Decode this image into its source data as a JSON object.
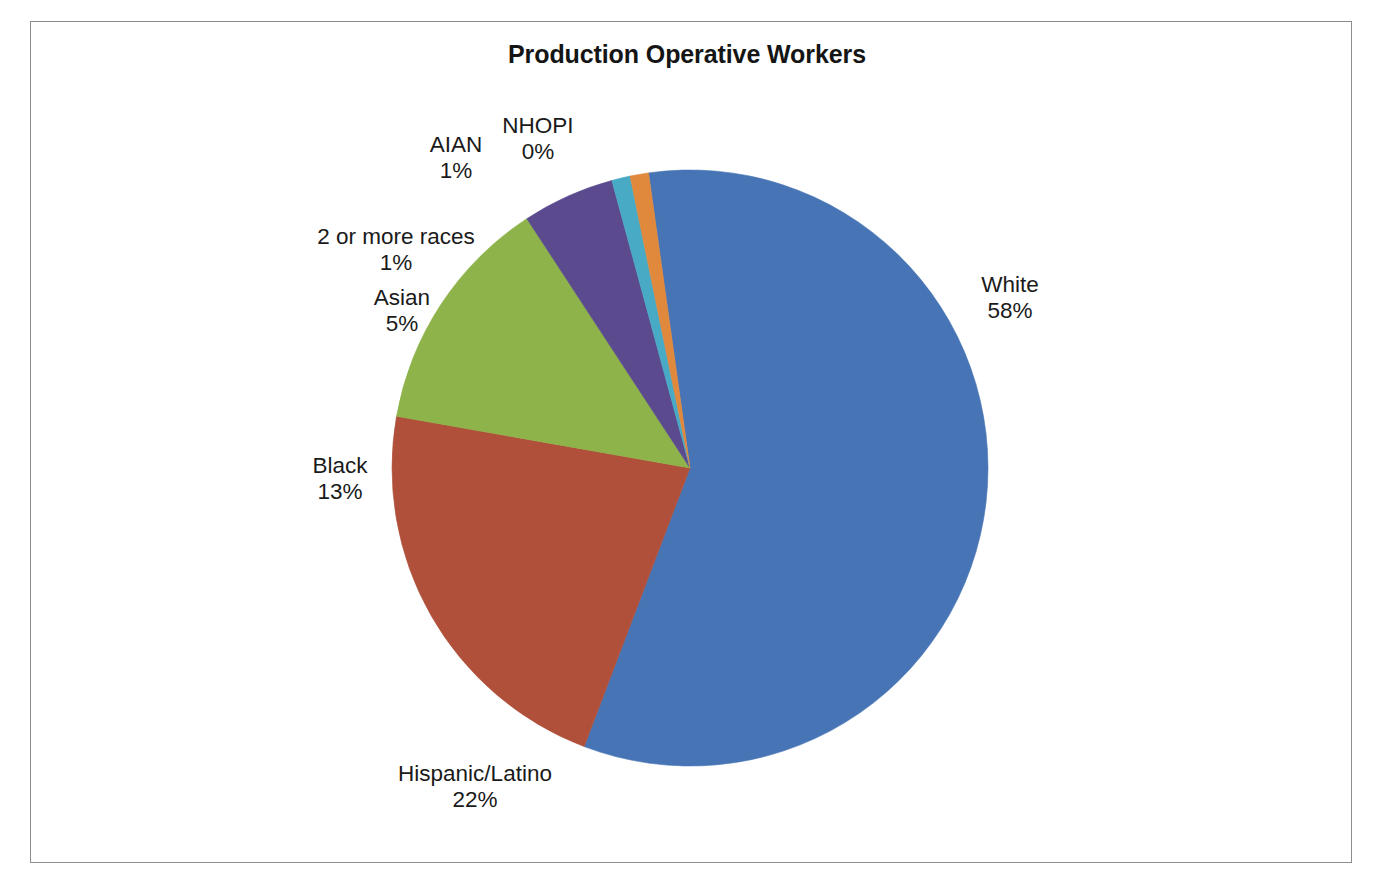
{
  "chart_data": {
    "type": "pie",
    "title": "Production Operative Workers",
    "xlabel": "",
    "ylabel": "",
    "legend": "none",
    "grid": false,
    "units": "percent",
    "categories": [
      "White",
      "Hispanic/Latino",
      "Black",
      "Asian",
      "2 or more races",
      "AIAN",
      "NHOPI"
    ],
    "values": [
      58,
      22,
      13,
      5,
      1,
      1,
      0
    ],
    "labels": [
      "58%",
      "22%",
      "13%",
      "5%",
      "1%",
      "1%",
      "0%"
    ],
    "colors": [
      "#4774B5",
      "#B0503A",
      "#8DB34A",
      "#5B4A8E",
      "#49AAC6",
      "#E0883C",
      "#1F6FA8"
    ],
    "slices": [
      {
        "name": "White",
        "value": 58,
        "pct_label": "58%",
        "color": "#4774B5"
      },
      {
        "name": "Hispanic/Latino",
        "value": 22,
        "pct_label": "22%",
        "color": "#B0503A"
      },
      {
        "name": "Black",
        "value": 13,
        "pct_label": "13%",
        "color": "#8DB34A"
      },
      {
        "name": "Asian",
        "value": 5,
        "pct_label": "5%",
        "color": "#5B4A8E"
      },
      {
        "name": "2 or more races",
        "value": 1,
        "pct_label": "1%",
        "color": "#49AAC6"
      },
      {
        "name": "AIAN",
        "value": 1,
        "pct_label": "1%",
        "color": "#E0883C"
      },
      {
        "name": "NHOPI",
        "value": 0,
        "pct_label": "0%",
        "color": "#1F6FA8"
      }
    ]
  },
  "title": {
    "text": "Production Operative Workers"
  },
  "labels": {
    "white": {
      "name": "White",
      "pct": "58%"
    },
    "hispanic": {
      "name": "Hispanic/Latino",
      "pct": "22%"
    },
    "black": {
      "name": "Black",
      "pct": "13%"
    },
    "asian": {
      "name": "Asian",
      "pct": "5%"
    },
    "two_or_more": {
      "name": "2 or more races",
      "pct": "1%"
    },
    "aian": {
      "name": "AIAN",
      "pct": "1%"
    },
    "nhopi": {
      "name": "NHOPI",
      "pct": "0%"
    }
  },
  "frame": {
    "border_color": "#8d8d8d",
    "background": "#ffffff"
  }
}
